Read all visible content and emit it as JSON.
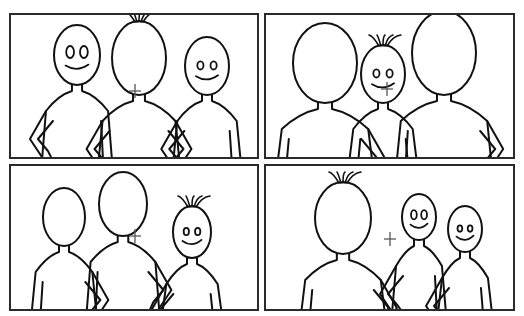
{
  "colors": {
    "stroke": "#111111",
    "border": "#2a2a2a",
    "background": "#ffffff",
    "cross": "#555555"
  },
  "panels": [
    {
      "id": "top-left",
      "box": {
        "x": 9,
        "y": 13,
        "w": 250,
        "h": 146
      },
      "cross": {
        "x": 124,
        "y": 76
      },
      "figures": [
        {
          "cx": 66,
          "headTop": 10,
          "rx": 23,
          "ry": 30,
          "facing": "front",
          "eyes": "large",
          "hair": false,
          "arm": "left-hip"
        },
        {
          "cx": 128,
          "headTop": 6,
          "rx": 27,
          "ry": 37,
          "facing": "back",
          "hair": true,
          "arm": "both-hip"
        },
        {
          "cx": 196,
          "headTop": 22,
          "rx": 22,
          "ry": 29,
          "facing": "front",
          "eyes": "small",
          "hair": false,
          "arm": "left-hip"
        }
      ]
    },
    {
      "id": "top-right",
      "box": {
        "x": 264,
        "y": 13,
        "w": 251,
        "h": 146
      },
      "cross": {
        "x": 121,
        "y": 74
      },
      "figures": [
        {
          "cx": 59,
          "headTop": 8,
          "rx": 32,
          "ry": 40,
          "facing": "back",
          "hair": false,
          "arm": "right-hip"
        },
        {
          "cx": 117,
          "headTop": 30,
          "rx": 22,
          "ry": 29,
          "facing": "front",
          "eyes": "small",
          "hair": true,
          "arm": "none"
        },
        {
          "cx": 178,
          "headTop": -4,
          "rx": 32,
          "ry": 42,
          "facing": "back",
          "hair": false,
          "arm": "right-hip"
        }
      ]
    },
    {
      "id": "bottom-left",
      "box": {
        "x": 9,
        "y": 164,
        "w": 250,
        "h": 147
      },
      "cross": {
        "x": 124,
        "y": 70
      },
      "figures": [
        {
          "cx": 53,
          "headTop": 22,
          "rx": 21,
          "ry": 29,
          "facing": "back",
          "hair": false,
          "arm": "right-hip"
        },
        {
          "cx": 112,
          "headTop": 6,
          "rx": 24,
          "ry": 32,
          "facing": "back",
          "hair": false,
          "arm": "right-hip"
        },
        {
          "cx": 181,
          "headTop": 40,
          "rx": 19,
          "ry": 26,
          "facing": "front",
          "eyes": "small",
          "hair": true,
          "arm": "left-hip"
        }
      ]
    },
    {
      "id": "bottom-right",
      "box": {
        "x": 264,
        "y": 164,
        "w": 251,
        "h": 147
      },
      "cross": {
        "x": 124,
        "y": 73
      },
      "figures": [
        {
          "cx": 77,
          "headTop": 16,
          "rx": 28,
          "ry": 36,
          "facing": "back",
          "hair": true,
          "arm": "right-hip"
        },
        {
          "cx": 153,
          "headTop": 28,
          "rx": 17,
          "ry": 23,
          "facing": "front",
          "eyes": "large",
          "hair": false,
          "arm": "left-hip"
        },
        {
          "cx": 199,
          "headTop": 40,
          "rx": 17,
          "ry": 23,
          "facing": "front",
          "eyes": "small",
          "hair": false,
          "arm": "left-hip"
        }
      ]
    }
  ]
}
